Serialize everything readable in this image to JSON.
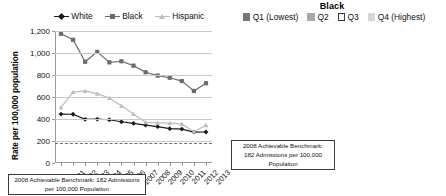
{
  "left": {
    "title": "",
    "legend": [
      {
        "label": "White",
        "color": "#1a1a1a",
        "marker": "diamond"
      },
      {
        "label": "Black",
        "color": "#6b6b6b",
        "marker": "square"
      },
      {
        "label": "Hispanic",
        "color": "#bdbdbd",
        "marker": "tri"
      }
    ],
    "ylabel": "Rate per 100,000 population",
    "yticks": [
      "0",
      "200",
      "400",
      "600",
      "800",
      "1,000",
      "1,200"
    ],
    "benchmark_text": [
      "2008 Achievable Benchmark: 182 Admissions",
      "per 100,000 Population"
    ]
  },
  "right": {
    "title": "Black",
    "legend": [
      {
        "label": "Q1 (Lowest)",
        "color": "#767676",
        "border": "#767676"
      },
      {
        "label": "Q2",
        "color": "#a8a8a8",
        "border": "#a8a8a8"
      },
      {
        "label": "Q3",
        "color": "#ffffff",
        "border": "#3a3a3a"
      },
      {
        "label": "Q4 (Highest)",
        "color": "#d6d6d6",
        "border": "#d6d6d6"
      }
    ],
    "ylabel": "Rate per 100,000 population",
    "yticks": [
      "0",
      "200",
      "400",
      "600",
      "800",
      "1,000",
      "1,200"
    ],
    "xlabel": "2013",
    "benchmark_text": [
      "2008 Achievable Benchmark:",
      "182 Admissions per 100,000",
      "Population"
    ]
  },
  "chart_data": [
    {
      "type": "line",
      "title": "",
      "xlabel": "",
      "ylabel": "Rate per 100,000 population",
      "ylim": [
        0,
        1200
      ],
      "ytick_step": 200,
      "grid": true,
      "legend_position": "top",
      "x": [
        "2001",
        "2002",
        "2003",
        "2004",
        "2005",
        "2006",
        "2007",
        "2008",
        "2009",
        "2010",
        "2011",
        "2012",
        "2013"
      ],
      "series": [
        {
          "name": "White",
          "color": "#1a1a1a",
          "marker": "diamond",
          "values": [
            445,
            443,
            397,
            398,
            393,
            375,
            360,
            345,
            330,
            312,
            308,
            281,
            282
          ]
        },
        {
          "name": "Black",
          "color": "#6b6b6b",
          "marker": "square",
          "values": [
            1175,
            1120,
            920,
            1010,
            915,
            925,
            885,
            825,
            795,
            775,
            745,
            655,
            725
          ]
        },
        {
          "name": "Hispanic",
          "color": "#bdbdbd",
          "marker": "tri",
          "values": [
            505,
            645,
            655,
            630,
            590,
            520,
            445,
            370,
            365,
            362,
            355,
            283,
            343
          ]
        }
      ],
      "benchmark": {
        "value": 182,
        "label": "2008 Achievable Benchmark: 182 Admissions per 100,000 Population"
      }
    },
    {
      "type": "bar",
      "title": "Black",
      "xlabel": "2013",
      "ylabel": "Rate per 100,000 population",
      "ylim": [
        0,
        1200
      ],
      "ytick_step": 200,
      "grid": true,
      "legend_position": "top",
      "categories": [
        "Q1 (Lowest)",
        "Q2",
        "Q3",
        "Q4 (Highest)"
      ],
      "values": [
        850,
        705,
        585,
        530
      ],
      "colors": [
        "#767676",
        "#a8a8a8",
        "#ffffff",
        "#d6d6d6"
      ],
      "benchmark": {
        "value": 182,
        "label": "2008 Achievable Benchmark: 182 Admissions per 100,000 Population"
      }
    }
  ]
}
